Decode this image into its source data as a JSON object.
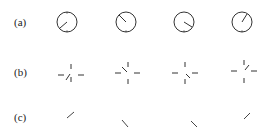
{
  "figure": {
    "rows": [
      {
        "label": "(a)",
        "style": "circle-dial",
        "items": [
          {
            "hand": "down-left"
          },
          {
            "hand": "up-left"
          },
          {
            "hand": "down-right"
          },
          {
            "hand": "up-right"
          }
        ]
      },
      {
        "label": "(b)",
        "style": "tick-cross",
        "items": [
          {
            "hand": "down-left"
          },
          {
            "hand": "up-left"
          },
          {
            "hand": "down-right"
          },
          {
            "hand": "up-right"
          }
        ]
      },
      {
        "label": "(c)",
        "style": "hand-only",
        "items": [
          {
            "hand": "down-left"
          },
          {
            "hand": "up-left"
          },
          {
            "hand": "down-right"
          },
          {
            "hand": "up-right"
          }
        ]
      }
    ],
    "colors": {
      "stroke": "#333333",
      "background": "#ffffff"
    }
  }
}
